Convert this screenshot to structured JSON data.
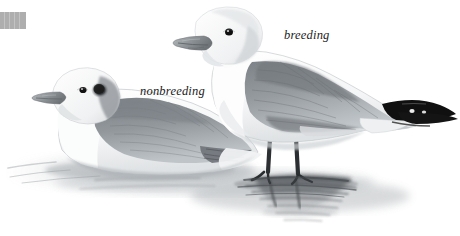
{
  "plate": {
    "title": "Gull plumage comparison plate",
    "medium": "graphite pencil illustration",
    "background_color": "#ffffff",
    "width": 460,
    "height": 236
  },
  "corner_swatch": {
    "name": "gray-corner-swatch",
    "color": "#a8a8a8",
    "x": 0,
    "y": 12,
    "width": 26,
    "height": 17
  },
  "labels": {
    "breeding": "breeding",
    "nonbreeding": "nonbreeding"
  },
  "subjects": [
    {
      "id": "breeding-gull",
      "label": "breeding",
      "posture": "standing in shallow water",
      "head_color": "#ffffff",
      "mantle_color": "#8e9398",
      "wingtip_color": "#111111",
      "wingtip_detail": "black primaries with white mirrors",
      "bill_color": "#8a8f93",
      "leg_color": "#2a2a2a",
      "eye_color": "#101010"
    },
    {
      "id": "nonbreeding-gull",
      "label": "nonbreeding",
      "posture": "sitting on water",
      "head_color": "#f2f2f2",
      "head_marking": "dark ear spot and nape smudge",
      "mantle_color": "#8a8f94",
      "bill_color": "#9aa0a4",
      "eye_color": "#101010"
    }
  ],
  "scene": {
    "water": "shallow water with pencil-shaded ripples and reflections",
    "reflection_color": "#5c6065",
    "shadow_color": "#b9bdc1"
  },
  "palette": {
    "ink_dark": "#111111",
    "gray_mid": "#8e9398",
    "gray_light": "#c9ced2",
    "gray_pale": "#e7eaec",
    "white": "#ffffff"
  }
}
